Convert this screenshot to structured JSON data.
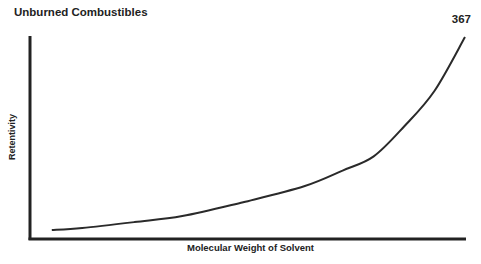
{
  "page": {
    "header_title": "Unburned Combustibles",
    "page_number": "367"
  },
  "chart_data": {
    "type": "line",
    "title": "",
    "xlabel": "Molecular Weight of Solvent",
    "ylabel": "Retentivity",
    "grid": false,
    "legend": null,
    "axis_ticks": "none (qualitative)",
    "x": [
      0.05,
      0.12,
      0.24,
      0.35,
      0.49,
      0.63,
      0.72,
      0.79,
      0.86,
      0.93,
      1.0
    ],
    "values": [
      0.03,
      0.04,
      0.07,
      0.1,
      0.17,
      0.25,
      0.33,
      0.4,
      0.55,
      0.73,
      1.0
    ],
    "series": [
      {
        "name": "Retentivity vs Molecular Weight",
        "trend": "exponential increase"
      }
    ]
  }
}
